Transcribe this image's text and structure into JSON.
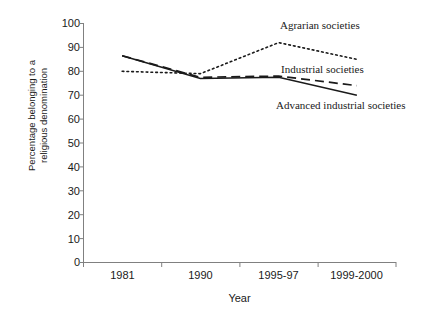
{
  "chart_data": {
    "type": "line",
    "title": "",
    "xlabel": "Year",
    "ylabel": "Percentage belonging to a\nreligious denomination",
    "categories": [
      "1981",
      "1990",
      "1995-97",
      "1999-2000"
    ],
    "ylim": [
      0,
      100
    ],
    "yticks": [
      0,
      10,
      20,
      30,
      40,
      50,
      60,
      70,
      80,
      90,
      100
    ],
    "ytick_labels": [
      "0",
      "10",
      "20",
      "30",
      "40",
      "50",
      "60",
      "70",
      "80",
      "90",
      "100"
    ],
    "grid": false,
    "legend_position": "inline-annotations",
    "series": [
      {
        "name": "Agrarian societies",
        "style": "dotted",
        "color": "#1a1a1a",
        "values": [
          80,
          79,
          92,
          85
        ]
      },
      {
        "name": "Industrial societies",
        "style": "dashed",
        "color": "#1a1a1a",
        "values": [
          86.5,
          77.5,
          78,
          74
        ]
      },
      {
        "name": "Advanced industrial societies",
        "style": "solid",
        "color": "#1a1a1a",
        "values": [
          86.5,
          77,
          77.5,
          70
        ]
      }
    ],
    "annotations": [
      {
        "text": "Agrarian societies",
        "x": 280,
        "y": 19
      },
      {
        "text": "Industrial societies",
        "x": 281,
        "y": 63
      },
      {
        "text": "Advanced industrial societies",
        "x": 276,
        "y": 99
      }
    ]
  },
  "axis": {
    "y_title": "Percentage belonging to a\nreligious denomination",
    "x_title": "Year"
  }
}
